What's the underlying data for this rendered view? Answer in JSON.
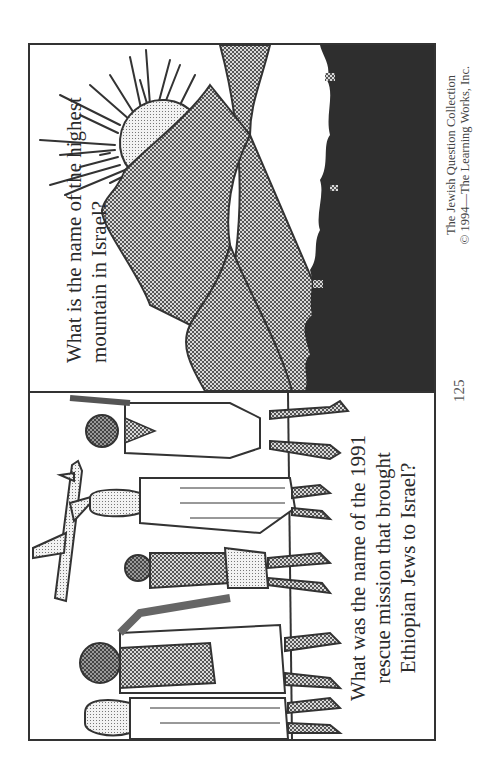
{
  "page": {
    "number": "125",
    "footer": {
      "line1": "The Jewish Question Collection",
      "line2": "© 1994—The Learning Works, Inc."
    }
  },
  "cards": [
    {
      "id": "mountain",
      "question_line1": "What is the name of the highest",
      "question_line2": "mountain in Israel?",
      "illustration": "sun-over-mountains"
    },
    {
      "id": "rescue",
      "question_line1": "What was the name of the 1991",
      "question_line2": "rescue mission that brought",
      "question_line3": "Ethiopian Jews to Israel?",
      "illustration": "family-walking-with-airplane"
    }
  ],
  "colors": {
    "border": "#333333",
    "shade": "#9a9a9a",
    "dark": "#2b2b2b"
  }
}
